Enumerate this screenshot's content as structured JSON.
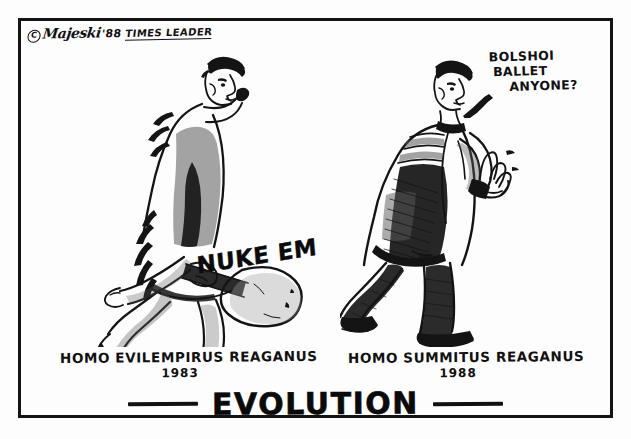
{
  "cartoon": {
    "title": "EVOLUTION",
    "background_color": "#fdfdfd",
    "ink_color": "#141414"
  },
  "signature": {
    "copyright_symbol": "C",
    "artist": "Majeski",
    "year": "'88",
    "publication": "TIMES LEADER"
  },
  "speech_balloon": {
    "line1": "BOLSHOI",
    "line2": "BALLET",
    "line3": "ANYONE?"
  },
  "club": {
    "label": "NUKE EM"
  },
  "panels": [
    {
      "id": "left",
      "caption_species": "HOMO EVILEMPIRUS REAGANUS",
      "caption_year": "1983",
      "figure_name": "caveman-reagan-figure",
      "description": "caveman in animal skins dragging a club"
    },
    {
      "id": "right",
      "caption_species": "HOMO SUMMITUS REAGANUS",
      "caption_year": "1988",
      "figure_name": "businessman-reagan-figure",
      "description": "same man upright in a business suit gesturing"
    }
  ],
  "title_dashes": {
    "left": "—",
    "right": "—"
  }
}
